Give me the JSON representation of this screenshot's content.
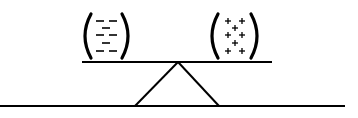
{
  "diagram": {
    "colors": {
      "ink": "#000000",
      "background": "#ffffff"
    },
    "left_group": {
      "label": "negative charges",
      "symbol": "−",
      "rows": [
        [
          "−",
          "−"
        ],
        [
          "−"
        ],
        [
          "−",
          "−"
        ],
        [
          "−"
        ],
        [
          "−",
          "−"
        ]
      ]
    },
    "right_group": {
      "label": "positive charges",
      "symbol": "+",
      "rows": [
        [
          "+",
          "+"
        ],
        [
          "+"
        ],
        [
          "+",
          "+"
        ],
        [
          "+"
        ],
        [
          "+",
          "+"
        ]
      ]
    },
    "beam": {
      "label": "seesaw beam"
    },
    "fulcrum": {
      "label": "triangular fulcrum"
    },
    "ground": {
      "label": "ground line"
    }
  }
}
